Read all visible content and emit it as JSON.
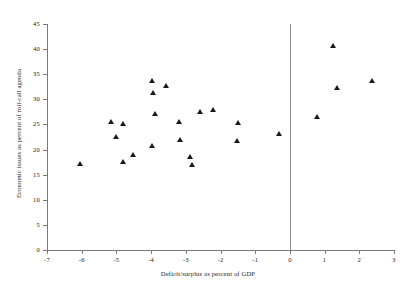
{
  "chart_data": {
    "type": "scatter",
    "title": "",
    "xlabel": "Deficit/surplus as percent of GDP",
    "ylabel": "Economic issues as percent of roll-call agenda",
    "xlim": [
      -7,
      3
    ],
    "ylim": [
      0,
      45
    ],
    "xticks": [
      "-7",
      "-6",
      "-5",
      "-4",
      "-3",
      "-2",
      "-1",
      "0",
      "1",
      "2",
      "3"
    ],
    "yticks": [
      "0",
      "5",
      "10",
      "15",
      "20",
      "25",
      "30",
      "35",
      "40",
      "45"
    ],
    "grid": false,
    "legend": "none",
    "marker": "triangle",
    "marker_color": "#1a1a1a",
    "reference_line_x": 0,
    "points": [
      {
        "x": -6.05,
        "y": 17.1
      },
      {
        "x": -5.15,
        "y": 25.6
      },
      {
        "x": -5.0,
        "y": 22.5
      },
      {
        "x": -4.8,
        "y": 25.2
      },
      {
        "x": -4.82,
        "y": 17.6
      },
      {
        "x": -4.52,
        "y": 19.0
      },
      {
        "x": -3.98,
        "y": 33.8
      },
      {
        "x": -3.95,
        "y": 31.4
      },
      {
        "x": -3.98,
        "y": 20.7
      },
      {
        "x": -3.88,
        "y": 27.2
      },
      {
        "x": -3.58,
        "y": 32.8
      },
      {
        "x": -3.18,
        "y": 25.5
      },
      {
        "x": -3.15,
        "y": 21.9
      },
      {
        "x": -2.88,
        "y": 18.6
      },
      {
        "x": -2.82,
        "y": 17.0
      },
      {
        "x": -2.6,
        "y": 27.6
      },
      {
        "x": -2.22,
        "y": 28.0
      },
      {
        "x": -1.5,
        "y": 25.3
      },
      {
        "x": -1.52,
        "y": 21.7
      },
      {
        "x": -0.3,
        "y": 23.1
      },
      {
        "x": 0.78,
        "y": 26.6
      },
      {
        "x": 1.25,
        "y": 40.6
      },
      {
        "x": 1.35,
        "y": 32.4
      },
      {
        "x": 2.38,
        "y": 33.7
      }
    ]
  }
}
